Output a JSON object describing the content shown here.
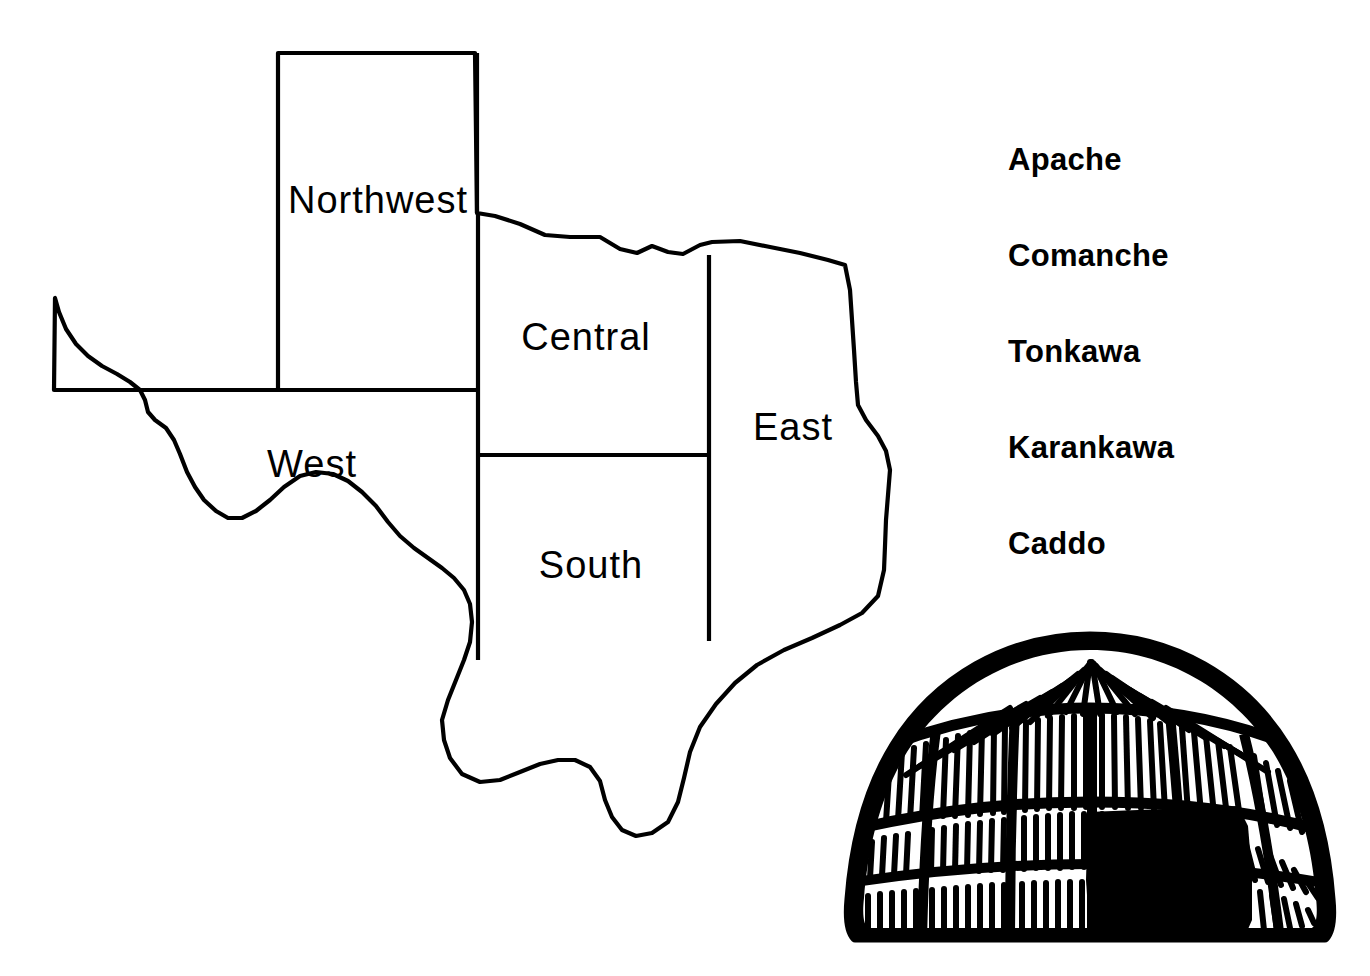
{
  "page": {
    "background_color": "#ffffff",
    "ink_color": "#000000"
  },
  "map": {
    "name": "Texas regions map",
    "regions": [
      {
        "id": "northwest",
        "label": "Northwest",
        "label_x": 378,
        "label_y": 213,
        "font_size": 38
      },
      {
        "id": "west",
        "label": "West",
        "label_x": 312,
        "label_y": 477,
        "font_size": 38
      },
      {
        "id": "central",
        "label": "Central",
        "label_x": 586,
        "label_y": 350,
        "font_size": 38
      },
      {
        "id": "south",
        "label": "South",
        "label_x": 591,
        "label_y": 578,
        "font_size": 38
      },
      {
        "id": "east",
        "label": "East",
        "label_x": 793,
        "label_y": 440,
        "font_size": 38
      }
    ],
    "divider_color": "#000000",
    "outline_color": "#000000",
    "fill_color": "#ffffff"
  },
  "tribes": {
    "title": "",
    "items": [
      {
        "label": "Apache"
      },
      {
        "label": "Comanche"
      },
      {
        "label": "Tonkawa"
      },
      {
        "label": "Karankawa"
      },
      {
        "label": "Caddo"
      }
    ]
  },
  "dwelling": {
    "name": "grass-house-dwelling",
    "description": "dome-shaped thatched grass house with dark doorway",
    "ink_color": "#000000",
    "doorway_color": "#000000"
  }
}
